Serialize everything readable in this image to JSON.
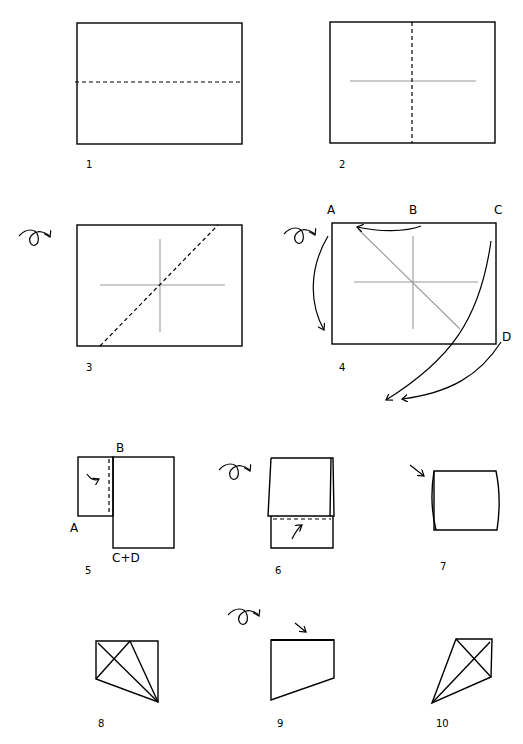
{
  "steps": [
    {
      "number": "1",
      "instruction": "valley fold horizontal center"
    },
    {
      "number": "2",
      "instruction": "valley fold vertical center"
    },
    {
      "number": "3",
      "instruction": "turn over, fold diagonal"
    },
    {
      "number": "4",
      "instruction": "turn over, collapse A, B, C, D"
    },
    {
      "number": "5",
      "instruction": "fold flap along dashed line"
    },
    {
      "number": "6",
      "instruction": "turn over, fold bottom up"
    },
    {
      "number": "7",
      "instruction": "press in"
    },
    {
      "number": "8",
      "instruction": "result with creases"
    },
    {
      "number": "9",
      "instruction": "turn over, press top edge"
    },
    {
      "number": "10",
      "instruction": "finished"
    }
  ],
  "point_labels": {
    "step4": {
      "a": "A",
      "b": "B",
      "c": "C",
      "d": "D"
    },
    "step5": {
      "a": "A",
      "b": "B",
      "cd": "C+D"
    }
  },
  "symbols": {
    "turn_over": "turn-over-icon",
    "fold_arrow": "fold-arrow-icon",
    "push_arrow": "push-arrow-icon"
  },
  "colors": {
    "line": "#000000",
    "crease": "#9a9a9a",
    "background": "#ffffff"
  }
}
